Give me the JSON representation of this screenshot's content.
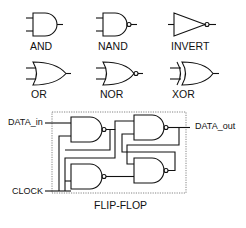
{
  "gates": [
    {
      "name": "AND"
    },
    {
      "name": "NAND"
    },
    {
      "name": "INVERT"
    },
    {
      "name": "OR"
    },
    {
      "name": "NOR"
    },
    {
      "name": "XOR"
    }
  ],
  "flip_flop": {
    "title": "FLIP-FLOP",
    "inputs": {
      "data": "DATA_in",
      "clock": "CLOCK"
    },
    "output": "DATA_out"
  },
  "colors": {
    "stroke": "#111111",
    "background": "#ffffff",
    "border": "#666666"
  }
}
